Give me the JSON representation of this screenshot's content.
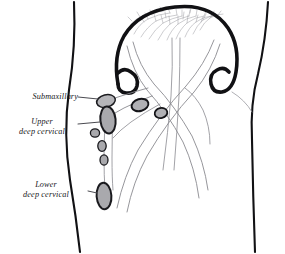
{
  "figure": {
    "background_color": "#ffffff",
    "width": 285,
    "height": 254
  },
  "labels": [
    {
      "id": "submaxillary",
      "line1": "Submaxillary",
      "line2": "",
      "name": "label-submaxillary"
    },
    {
      "id": "upper_deep_cervical",
      "line1": "Upper",
      "line2": "deep cervical",
      "name": "label-upper-deep-cervical"
    },
    {
      "id": "lower_deep_cervical",
      "line1": "Lower",
      "line2": "deep cervical",
      "name": "label-lower-deep-cervical"
    }
  ],
  "colors": {
    "outline_dark": "#111114",
    "node_stroke": "#1a1a1e",
    "node_fill": "#a9a9ad",
    "node_fill_light": "#bcbcc0",
    "vessel": "#8a8a90",
    "vessel_fine": "#9b9ba1",
    "leader_line": "#4a4a50",
    "text": "#16161a",
    "background": "#ffffff"
  },
  "anatomy": {
    "head_outline_label": "jaw-and-chin-arc",
    "neck_left_label": "neck-left-contour",
    "neck_right_label": "neck-right-contour",
    "plexus_label": "facial-lymphatic-plexus",
    "node_groups": [
      {
        "id": "submaxillary",
        "count": 1,
        "shape": "oval"
      },
      {
        "id": "upper_deep_cervical",
        "count": 4,
        "shape": "oval-chain"
      },
      {
        "id": "jugulodigastric",
        "count": 2,
        "shape": "oval"
      },
      {
        "id": "lower_deep_cervical",
        "count": 1,
        "shape": "elongated-oval"
      }
    ]
  }
}
